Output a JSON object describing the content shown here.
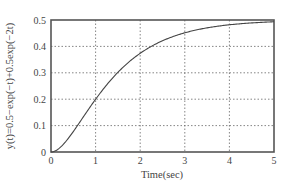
{
  "chart_data": {
    "type": "line",
    "title": "",
    "xlabel": "Time(sec)",
    "ylabel": "y(t)=0.5−exp(−t)+0.5exp(−2t)",
    "xlim": [
      0,
      5
    ],
    "ylim": [
      0,
      0.5
    ],
    "xticks": [
      "0",
      "1",
      "2",
      "3",
      "4",
      "5"
    ],
    "yticks": [
      "0",
      "0.1",
      "0.2",
      "0.3",
      "0.4",
      "0.5"
    ],
    "grid": true,
    "legend": null,
    "series": [
      {
        "name": "y(t)",
        "x": [
          0,
          0.25,
          0.5,
          0.75,
          1,
          1.25,
          1.5,
          1.75,
          2,
          2.5,
          3,
          3.5,
          4,
          4.5,
          5
        ],
        "values": [
          0,
          0.0448,
          0.1548,
          0.1115,
          0.1998,
          0.2455,
          0.2518,
          0.3274,
          0.3738,
          0.4214,
          0.4514,
          0.4706,
          0.482,
          0.489,
          0.4933
        ]
      }
    ],
    "function": "0.5-exp(-t)+0.5*exp(-2t)",
    "colors": {
      "line": "#444444",
      "grid": "#666666",
      "axes": "#555555"
    }
  }
}
